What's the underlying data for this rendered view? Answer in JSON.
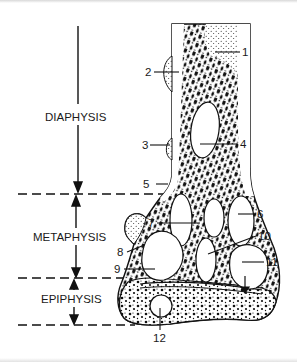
{
  "figure": {
    "regions": [
      {
        "label": "DIAPHYSIS"
      },
      {
        "label": "METAPHYSIS"
      },
      {
        "label": "EPIPHYSIS"
      }
    ],
    "callouts": [
      "1",
      "2",
      "3",
      "4",
      "5",
      "6",
      "7",
      "8",
      "9",
      "10",
      "11",
      "12"
    ]
  }
}
